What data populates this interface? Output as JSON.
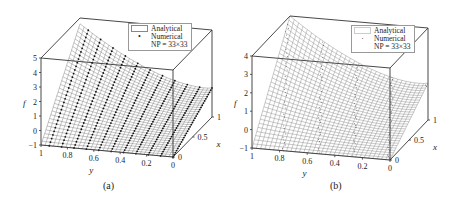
{
  "chart_data": [
    {
      "type": "surface3d",
      "panel_label": "(a)",
      "zlabel": "f",
      "xlabel": "x",
      "ylabel": "y",
      "z_ticks": [
        "-1",
        "0",
        "1",
        "2",
        "3",
        "4",
        "5"
      ],
      "zlim": [
        -1,
        5
      ],
      "y_ticks": [
        "1",
        "0.8",
        "0.6",
        "0.4",
        "0.2",
        "0"
      ],
      "ylim": [
        1,
        0
      ],
      "x_ticks": [
        "0",
        "0.5",
        "1"
      ],
      "xlim": [
        0,
        1
      ],
      "grid": "33x33",
      "legend": {
        "analytical": "Analytical",
        "numerical": "Numerical",
        "np": "NP = 33×33",
        "marker": "•"
      },
      "surface_description": "Analytical mesh surface with numerical dots; f peaks ≈4.6 at (x=1, y=1) and decreases to ≈1 at y=0, ≈-1 at (x=0,y=1)"
    },
    {
      "type": "surface3d",
      "panel_label": "(b)",
      "zlabel": "f",
      "xlabel": "x",
      "ylabel": "y",
      "z_ticks": [
        "-1",
        "0",
        "1",
        "2",
        "3",
        "4"
      ],
      "zlim": [
        -1,
        4
      ],
      "y_ticks": [
        "1",
        "0.8",
        "0.6",
        "0.4",
        "0.2",
        "0"
      ],
      "ylim": [
        1,
        0
      ],
      "x_ticks": [
        "0",
        "0.5",
        "1"
      ],
      "xlim": [
        0,
        1
      ],
      "grid": "33x33",
      "legend": {
        "analytical": "Analytical",
        "numerical": "Numerical",
        "np": "NP = 33×33",
        "marker": "·"
      },
      "surface_description": "Analytical mesh surface with numerical points; f peaks ≈4 at (x=1, y=1) and decreases toward ≈1 at y=0, ≈-1 at (x=0,y=1)"
    }
  ]
}
